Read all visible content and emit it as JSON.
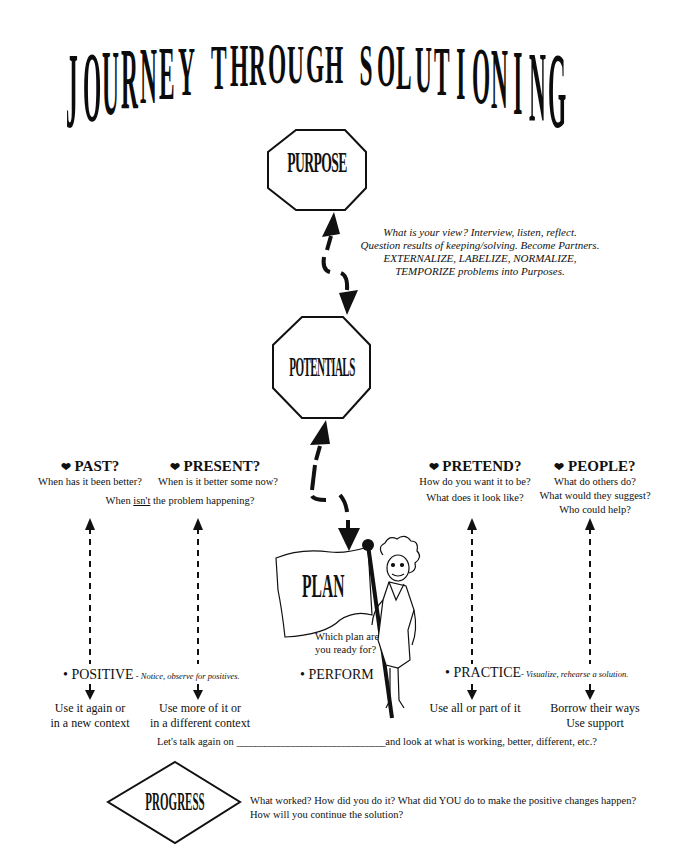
{
  "title": {
    "text": "JOURNEY THROUGH SOLUTIONING",
    "letters": [
      "J",
      "O",
      "U",
      "R",
      "N",
      "E",
      "Y",
      " ",
      "T",
      "H",
      "R",
      "O",
      "U",
      "G",
      "H",
      " ",
      "S",
      "O",
      "L",
      "U",
      "T",
      "I",
      "O",
      "N",
      "I",
      "N",
      "G"
    ]
  },
  "nodes": {
    "purpose": {
      "label": "PURPOSE",
      "shape": "octagon"
    },
    "potentials": {
      "label": "POTENTIALS",
      "shape": "octagon"
    },
    "plan": {
      "label": "PLAN",
      "shape": "flag",
      "note_line1": "Which plan are",
      "note_line2": "you ready for?"
    },
    "progress": {
      "label": "PROGRESS",
      "shape": "diamond"
    }
  },
  "purpose_note": {
    "line1": "What is your view? Interview, listen, reflect.",
    "line2": "Question results of keeping/solving. Become Partners.",
    "line3": "EXTERNALIZE, LABELIZE, NORMALIZE,",
    "line4": "TEMPORIZE problems into Purposes."
  },
  "columns": {
    "past": {
      "icon": "heart-icon",
      "heading": "PAST?",
      "question": "When has it been better?",
      "outcome_line1": "Use it again or",
      "outcome_line2": "in a new context"
    },
    "present": {
      "icon": "heart-icon",
      "heading": "PRESENT?",
      "question": "When is it better some now?",
      "outcome_line1": "Use more of it or",
      "outcome_line2": "in a different context"
    },
    "pretend": {
      "icon": "heart-icon",
      "heading": "PRETEND?",
      "question1": "How do you want it to be?",
      "question2": "What does it look like?",
      "outcome_line1": "Use all or part of it"
    },
    "people": {
      "icon": "heart-icon",
      "heading": "PEOPLE?",
      "question1": "What do others do?",
      "question2": "What would they suggest?",
      "question3": "Who could help?",
      "outcome_line1": "Borrow their ways",
      "outcome_line2": "Use support"
    }
  },
  "shared_question": {
    "prefix": "When ",
    "emphasis": "isn't",
    "suffix": " the problem happening?"
  },
  "bullets": {
    "positive": {
      "label": "POSITIVE",
      "note": " - Notice, observe for positives."
    },
    "perform": {
      "label": "PERFORM"
    },
    "practice": {
      "label": "PRACTICE",
      "note": "- Visualize, rehearse a solution."
    }
  },
  "followup": {
    "prefix": "Let's talk again  on",
    "blank": "________________________________",
    "suffix": "and look at what is working, better, different, etc.?"
  },
  "progress_note": {
    "line1": "What worked?  How did you do it?  What did YOU do to make the positive changes happen?",
    "line2": "How will you continue the solution?"
  },
  "symbols": {
    "bullet": "•",
    "heart": "❤"
  }
}
